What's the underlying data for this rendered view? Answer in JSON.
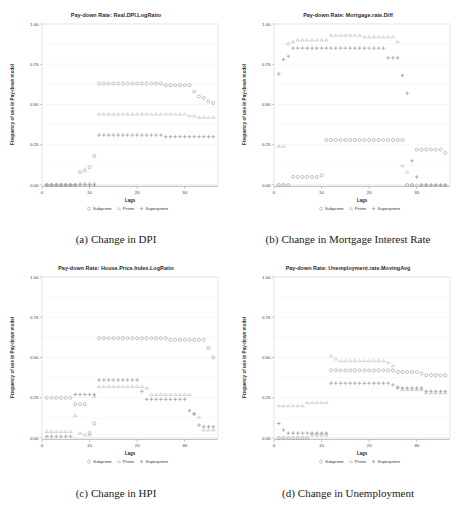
{
  "figure": {
    "panel_order": [
      "a",
      "b",
      "c",
      "d"
    ]
  },
  "panels": [
    {
      "key": "a",
      "title": "Pay-down Rate: Real.DPI.LogRatio",
      "caption_label": "(a)",
      "caption_text": "Change in DPI"
    },
    {
      "key": "b",
      "title": "Pay-down Rate: Mortgage.rate.Diff",
      "caption_label": "(b)",
      "caption_text": "Change in Mortgage Interest Rate"
    },
    {
      "key": "c",
      "title": "Pay-down Rate: House.Price.Index.LogRatio",
      "caption_label": "(c)",
      "caption_text": "Change in HPI"
    },
    {
      "key": "d",
      "title": "Pay-down Rate: Unemployment.rate.MovingAvg",
      "caption_label": "(d)",
      "caption_text": "Change in Unemployment"
    }
  ],
  "axes": {
    "xlabel": "Lags",
    "ylabel": "Frequency of use in Pay-down model",
    "xticks": [
      0,
      10,
      20,
      30
    ],
    "xticklabels": [
      "0",
      "10",
      "20",
      "30"
    ],
    "yticks": [
      0.0,
      0.25,
      0.5,
      0.75,
      1.0
    ],
    "yticklabels": [
      "0.00",
      "0.25",
      "0.50",
      "0.75",
      "1.00"
    ],
    "xlim": [
      0,
      37
    ],
    "ylim": [
      0,
      1
    ]
  },
  "legend": {
    "position": "below-axis",
    "entries": [
      {
        "label": "Subprime",
        "marker": "circle-marker",
        "color": "#9a9a9a"
      },
      {
        "label": "Prime",
        "marker": "triangle-marker",
        "color": "#b0b0b0"
      },
      {
        "label": "Superprime",
        "marker": "plus-marker",
        "color": "#8e8e8e"
      }
    ]
  },
  "colors": {
    "subprime": "#8f8f8f",
    "prime": "#b2b2b2",
    "superprime": "#8a8a8a",
    "panel_border": "#c8c8c8",
    "gridline": "#ededed",
    "axis_line": "#8a8a8a",
    "background": "#ffffff"
  },
  "chart_data": [
    {
      "type": "scatter",
      "panel": "a",
      "title": "Pay-down Rate: Real.DPI.LogRatio",
      "xlabel": "Lags",
      "ylabel": "Frequency of use in Pay-down model",
      "xlim": [
        0,
        37
      ],
      "ylim": [
        0,
        1
      ],
      "grid": true,
      "legend": [
        "Subprime",
        "Prime",
        "Superprime"
      ],
      "x": [
        1,
        2,
        3,
        4,
        5,
        6,
        7,
        8,
        9,
        10,
        11,
        12,
        13,
        14,
        15,
        16,
        17,
        18,
        19,
        20,
        21,
        22,
        23,
        24,
        25,
        26,
        27,
        28,
        29,
        30,
        31,
        32,
        33,
        34,
        35,
        36
      ],
      "series": [
        {
          "name": "Subprime",
          "marker": "circle",
          "values": [
            0.0,
            0.0,
            0.0,
            0.0,
            0.0,
            0.0,
            0.0,
            0.08,
            0.09,
            0.11,
            0.18,
            0.63,
            0.63,
            0.63,
            0.63,
            0.63,
            0.63,
            0.63,
            0.63,
            0.63,
            0.63,
            0.63,
            0.63,
            0.63,
            0.63,
            0.62,
            0.62,
            0.62,
            0.62,
            0.62,
            0.62,
            0.58,
            0.55,
            0.54,
            0.52,
            0.51
          ]
        },
        {
          "name": "Prime",
          "marker": "triangle",
          "values": [
            0.0,
            0.0,
            0.0,
            0.0,
            0.0,
            0.0,
            0.0,
            0.01,
            0.01,
            0.01,
            0.01,
            0.44,
            0.44,
            0.44,
            0.44,
            0.44,
            0.44,
            0.44,
            0.44,
            0.44,
            0.44,
            0.44,
            0.44,
            0.44,
            0.44,
            0.44,
            0.44,
            0.44,
            0.44,
            0.44,
            0.43,
            0.43,
            0.42,
            0.42,
            0.42,
            0.42
          ]
        },
        {
          "name": "Superprime",
          "marker": "plus",
          "values": [
            0.0,
            0.0,
            0.0,
            0.0,
            0.0,
            0.0,
            0.0,
            0.0,
            0.0,
            0.0,
            0.0,
            0.31,
            0.31,
            0.31,
            0.31,
            0.31,
            0.31,
            0.31,
            0.31,
            0.31,
            0.31,
            0.31,
            0.31,
            0.31,
            0.31,
            0.3,
            0.3,
            0.3,
            0.3,
            0.3,
            0.3,
            0.3,
            0.3,
            0.3,
            0.3,
            0.3
          ]
        }
      ]
    },
    {
      "type": "scatter",
      "panel": "b",
      "title": "Pay-down Rate: Mortgage.rate.Diff",
      "xlabel": "Lags",
      "ylabel": "Frequency of use in Pay-down model",
      "xlim": [
        0,
        37
      ],
      "ylim": [
        0,
        1
      ],
      "grid": true,
      "legend": [
        "Subprime",
        "Prime",
        "Superprime"
      ],
      "x": [
        1,
        2,
        3,
        4,
        5,
        6,
        7,
        8,
        9,
        10,
        11,
        12,
        13,
        14,
        15,
        16,
        17,
        18,
        19,
        20,
        21,
        22,
        23,
        24,
        25,
        26,
        27,
        28,
        29,
        30,
        31,
        32,
        33,
        34,
        35,
        36
      ],
      "series": [
        {
          "name": "Subprime",
          "marker": "circle",
          "values": [
            0.0,
            0.0,
            0.0,
            0.05,
            0.05,
            0.05,
            0.05,
            0.05,
            0.05,
            0.06,
            0.28,
            0.28,
            0.28,
            0.28,
            0.28,
            0.28,
            0.28,
            0.28,
            0.28,
            0.28,
            0.28,
            0.28,
            0.28,
            0.28,
            0.28,
            0.28,
            0.28,
            0.0,
            0.0,
            0.22,
            0.22,
            0.22,
            0.22,
            0.22,
            0.22,
            0.2
          ]
        },
        {
          "name": "Prime",
          "marker": "triangle",
          "values": [
            0.24,
            0.24,
            0.88,
            0.89,
            0.9,
            0.9,
            0.9,
            0.9,
            0.9,
            0.9,
            0.9,
            0.93,
            0.93,
            0.93,
            0.93,
            0.93,
            0.93,
            0.93,
            0.92,
            0.92,
            0.92,
            0.92,
            0.92,
            0.92,
            0.92,
            0.89,
            0.12,
            0.08,
            0.0,
            0.0,
            0.0,
            0.0,
            0.0,
            0.0,
            0.0,
            0.0
          ]
        },
        {
          "name": "Superprime",
          "marker": "plus",
          "values": [
            0.69,
            0.78,
            0.8,
            0.85,
            0.85,
            0.85,
            0.85,
            0.85,
            0.85,
            0.85,
            0.85,
            0.85,
            0.85,
            0.85,
            0.85,
            0.85,
            0.85,
            0.85,
            0.85,
            0.85,
            0.85,
            0.85,
            0.85,
            0.79,
            0.79,
            0.79,
            0.68,
            0.57,
            0.15,
            0.05,
            0.0,
            0.0,
            0.0,
            0.0,
            0.0,
            0.0
          ]
        }
      ]
    },
    {
      "type": "scatter",
      "panel": "c",
      "title": "Pay-down Rate: House.Price.Index.LogRatio",
      "xlabel": "Lags",
      "ylabel": "Frequency of use in Pay-down model",
      "xlim": [
        0,
        37
      ],
      "ylim": [
        0,
        1
      ],
      "grid": true,
      "legend": [
        "Subprime",
        "Prime",
        "Superprime"
      ],
      "x": [
        1,
        2,
        3,
        4,
        5,
        6,
        7,
        8,
        9,
        10,
        11,
        12,
        13,
        14,
        15,
        16,
        17,
        18,
        19,
        20,
        21,
        22,
        23,
        24,
        25,
        26,
        27,
        28,
        29,
        30,
        31,
        32,
        33,
        34,
        35,
        36
      ],
      "series": [
        {
          "name": "Subprime",
          "marker": "circle",
          "values": [
            0.25,
            0.25,
            0.25,
            0.25,
            0.25,
            0.25,
            0.21,
            0.21,
            0.21,
            0.03,
            0.09,
            0.62,
            0.62,
            0.62,
            0.62,
            0.62,
            0.62,
            0.62,
            0.62,
            0.62,
            0.62,
            0.62,
            0.62,
            0.62,
            0.62,
            0.62,
            0.61,
            0.61,
            0.61,
            0.61,
            0.61,
            0.61,
            0.61,
            0.61,
            0.56,
            0.5
          ]
        },
        {
          "name": "Prime",
          "marker": "triangle",
          "values": [
            0.04,
            0.04,
            0.04,
            0.04,
            0.04,
            0.04,
            0.14,
            0.03,
            0.02,
            0.02,
            0.26,
            0.32,
            0.32,
            0.32,
            0.32,
            0.32,
            0.32,
            0.32,
            0.32,
            0.32,
            0.32,
            0.31,
            0.27,
            0.27,
            0.27,
            0.27,
            0.27,
            0.27,
            0.27,
            0.27,
            0.27,
            0.15,
            0.13,
            0.05,
            0.05,
            0.05
          ]
        },
        {
          "name": "Superprime",
          "marker": "plus",
          "values": [
            0.01,
            0.01,
            0.01,
            0.01,
            0.01,
            0.01,
            0.27,
            0.27,
            0.27,
            0.27,
            0.27,
            0.36,
            0.36,
            0.36,
            0.36,
            0.36,
            0.36,
            0.36,
            0.36,
            0.36,
            0.29,
            0.24,
            0.24,
            0.24,
            0.24,
            0.24,
            0.24,
            0.24,
            0.24,
            0.24,
            0.17,
            0.15,
            0.08,
            0.07,
            0.07,
            0.07
          ]
        }
      ]
    },
    {
      "type": "scatter",
      "panel": "d",
      "title": "Pay-down Rate: Unemployment.rate.MovingAvg",
      "xlabel": "Lags",
      "ylabel": "Frequency of use in Pay-down model",
      "xlim": [
        0,
        37
      ],
      "ylim": [
        0,
        1
      ],
      "grid": true,
      "legend": [
        "Subprime",
        "Prime",
        "Superprime"
      ],
      "x": [
        1,
        2,
        3,
        4,
        5,
        6,
        7,
        8,
        9,
        10,
        11,
        12,
        13,
        14,
        15,
        16,
        17,
        18,
        19,
        20,
        21,
        22,
        23,
        24,
        25,
        26,
        27,
        28,
        29,
        30,
        31,
        32,
        33,
        34,
        35,
        36
      ],
      "series": [
        {
          "name": "Subprime",
          "marker": "circle",
          "values": [
            0.0,
            0.0,
            0.0,
            0.0,
            0.0,
            0.0,
            0.0,
            0.02,
            0.02,
            0.02,
            0.02,
            0.42,
            0.42,
            0.42,
            0.42,
            0.42,
            0.42,
            0.42,
            0.42,
            0.42,
            0.42,
            0.42,
            0.42,
            0.42,
            0.42,
            0.41,
            0.41,
            0.41,
            0.41,
            0.41,
            0.4,
            0.39,
            0.39,
            0.39,
            0.39,
            0.39
          ]
        },
        {
          "name": "Prime",
          "marker": "triangle",
          "values": [
            0.2,
            0.2,
            0.2,
            0.2,
            0.2,
            0.2,
            0.22,
            0.22,
            0.22,
            0.22,
            0.22,
            0.51,
            0.49,
            0.48,
            0.48,
            0.48,
            0.48,
            0.48,
            0.48,
            0.48,
            0.48,
            0.48,
            0.48,
            0.47,
            0.45,
            0.32,
            0.3,
            0.3,
            0.3,
            0.3,
            0.3,
            0.28,
            0.28,
            0.28,
            0.28,
            0.28
          ]
        },
        {
          "name": "Superprime",
          "marker": "plus",
          "values": [
            0.09,
            0.05,
            0.03,
            0.03,
            0.03,
            0.03,
            0.03,
            0.03,
            0.03,
            0.03,
            0.03,
            0.34,
            0.34,
            0.34,
            0.34,
            0.34,
            0.34,
            0.34,
            0.34,
            0.34,
            0.34,
            0.34,
            0.34,
            0.34,
            0.33,
            0.31,
            0.31,
            0.31,
            0.31,
            0.31,
            0.31,
            0.29,
            0.29,
            0.29,
            0.29,
            0.29
          ]
        }
      ]
    }
  ]
}
